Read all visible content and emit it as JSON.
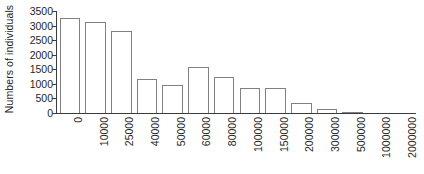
{
  "chart_data": {
    "type": "bar",
    "title": "",
    "subtitle": "",
    "xlabel": "",
    "ylabel": "Numbers of individuals",
    "categories": [
      "0",
      "10000",
      "25000",
      "40000",
      "50000",
      "60000",
      "80000",
      "100000",
      "150000",
      "200000",
      "300000",
      "500000",
      "1000000",
      "2000000"
    ],
    "values": [
      3270,
      3120,
      2800,
      1160,
      970,
      1580,
      1220,
      860,
      850,
      340,
      150,
      40,
      25,
      0
    ],
    "ylim": [
      0,
      3500
    ],
    "yticks": [
      0,
      500,
      1000,
      1500,
      2000,
      2500,
      3000,
      3500
    ],
    "ytick_labels": [
      "0",
      "500",
      "1000",
      "1500",
      "2000",
      "2500",
      "3000",
      "3500"
    ],
    "grid": false,
    "legend": null,
    "legend_position": "none",
    "bar_edge_color": "#808084",
    "bar_fill_color": "#ffffff",
    "axis_color": "#3b3b3b",
    "background_color": "#ffffff",
    "annotations": []
  }
}
